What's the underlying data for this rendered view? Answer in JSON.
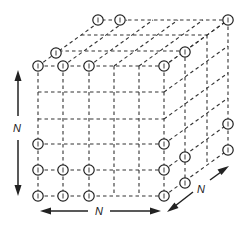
{
  "figure": {
    "colors": {
      "line": "#333333",
      "background": "#ffffff"
    },
    "front_face": {
      "columns_x": [
        38,
        63,
        89,
        114,
        139,
        164
      ],
      "rows_y": [
        66,
        92,
        119,
        144,
        170,
        196
      ]
    },
    "depth_offsets": [
      [
        0,
        0
      ],
      [
        21,
        -15
      ],
      [
        43,
        -31
      ],
      [
        64,
        -46
      ]
    ],
    "nodes": [
      {
        "x": 38,
        "y": 66
      },
      {
        "x": 63,
        "y": 66
      },
      {
        "x": 89,
        "y": 66
      },
      {
        "x": 164,
        "y": 66
      },
      {
        "x": 56,
        "y": 53
      },
      {
        "x": 185,
        "y": 52
      },
      {
        "x": 98,
        "y": 20
      },
      {
        "x": 120,
        "y": 20
      },
      {
        "x": 228,
        "y": 20
      },
      {
        "x": 38,
        "y": 144
      },
      {
        "x": 164,
        "y": 144
      },
      {
        "x": 38,
        "y": 170
      },
      {
        "x": 63,
        "y": 170
      },
      {
        "x": 89,
        "y": 170
      },
      {
        "x": 164,
        "y": 170
      },
      {
        "x": 38,
        "y": 196
      },
      {
        "x": 63,
        "y": 196
      },
      {
        "x": 89,
        "y": 196
      },
      {
        "x": 164,
        "y": 196
      },
      {
        "x": 185,
        "y": 157
      },
      {
        "x": 185,
        "y": 183
      },
      {
        "x": 228,
        "y": 124
      },
      {
        "x": 228,
        "y": 150
      }
    ],
    "labels": {
      "vertical_dimension": "N",
      "horizontal_dimension": "N",
      "depth_dimension": "N"
    }
  }
}
